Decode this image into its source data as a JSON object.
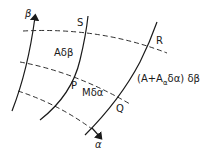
{
  "diagram": {
    "axes": {
      "beta": "β",
      "alpha": "α"
    },
    "points": {
      "S": "S",
      "R": "R",
      "P": "P",
      "Q": "Q"
    },
    "labels": {
      "left_side": "Aδβ",
      "bottom_side": "Mδα",
      "right_side_open": "(A+A",
      "right_side_sub": "α",
      "right_side_close": "δα) δβ"
    },
    "colors": {
      "line": "#1a1a1a",
      "background": "#ffffff"
    }
  }
}
